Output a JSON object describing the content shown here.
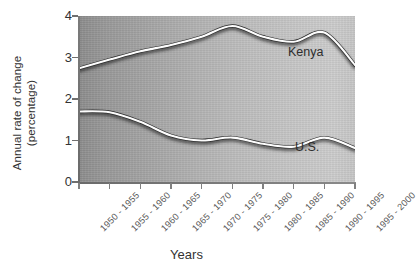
{
  "chart_data": {
    "type": "line",
    "title": "",
    "xlabel": "Years",
    "ylabel": "Annual rate of change\n(percentage)",
    "ylim": [
      0,
      4
    ],
    "yticks": [
      "0",
      "1",
      "2",
      "3",
      "4"
    ],
    "grid": false,
    "legend_position": "inline-labels",
    "categories": [
      "1950 - 1955",
      "1955 - 1960",
      "1960 - 1965",
      "1965 - 1970",
      "1970 - 1975",
      "1975 - 1980",
      "1980 - 1985",
      "1985 - 1990",
      "1990 - 1995",
      "1995 - 2000"
    ],
    "series": [
      {
        "name": "Kenya",
        "color": "#2f2f2f",
        "values": [
          2.74,
          2.95,
          3.15,
          3.3,
          3.5,
          3.76,
          3.5,
          3.38,
          3.6,
          2.82
        ]
      },
      {
        "name": "U.S.",
        "color": "#2f2f2f",
        "values": [
          1.7,
          1.68,
          1.45,
          1.12,
          1.0,
          1.07,
          0.92,
          0.85,
          1.07,
          0.82
        ]
      }
    ]
  },
  "axis": {
    "x_title": "Years",
    "y_title_line1": "Annual rate of change",
    "y_title_line2": "(percentage)"
  },
  "labels": {
    "kenya": "Kenya",
    "us": "U.S."
  }
}
